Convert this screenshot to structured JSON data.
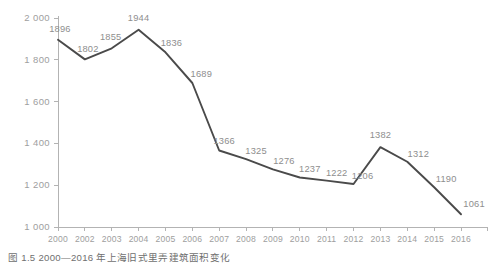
{
  "caption": "图 1.5    2000—2016 年上海旧式里弄建筑面积变化",
  "colors": {
    "line": "#4a4a4a",
    "axis": "#b3b3b3",
    "tick_label": "#9e9e9e",
    "value_label": "#8e8e8e",
    "dropline": "#c8c8c8",
    "background": "#ffffff"
  },
  "chart_data": {
    "type": "line",
    "title": "",
    "subtitle": "",
    "xlabel": "",
    "ylabel": "",
    "categories": [
      "2000",
      "2002",
      "2003",
      "2004",
      "2005",
      "2006",
      "2007",
      "2008",
      "2009",
      "2010",
      "2011",
      "2012",
      "2013",
      "2014",
      "2015",
      "2016"
    ],
    "values": [
      1896,
      1802,
      1855,
      1944,
      1836,
      1689,
      1366,
      1325,
      1276,
      1237,
      1222,
      1206,
      1382,
      1312,
      1190,
      1061
    ],
    "point_labels": [
      "1896",
      "1802",
      "1855",
      "1944",
      "1836",
      "1689",
      "1366",
      "1325",
      "1276",
      "1237",
      "1222",
      "1206",
      "1382",
      "1312",
      "1190",
      "1061"
    ],
    "ylim": [
      1000,
      2000
    ],
    "ytick_values": [
      1000,
      1200,
      1400,
      1600,
      1800,
      2000
    ],
    "ytick_labels": [
      "1 000",
      "1 200",
      "1 400",
      "1 600",
      "1 800",
      "2 000"
    ],
    "grid": false,
    "legend": null,
    "droplines": true,
    "annotations": []
  }
}
